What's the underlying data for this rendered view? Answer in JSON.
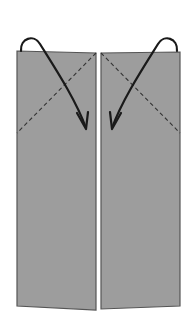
{
  "diagram": {
    "type": "origami-fold-step",
    "colors": {
      "background": "#ffffff",
      "paper_fill": "#9d9d9d",
      "paper_edge": "#555555",
      "fold_line": "#333333",
      "arrow": "#1a1a1a",
      "center_gap": "#ffffff"
    },
    "panels": [
      {
        "name": "left-flap",
        "points": "17,51 96,53 96,310 17,306"
      },
      {
        "name": "right-flap",
        "points": "101,53 180,52 180,306 101,309"
      }
    ],
    "fold_lines": [
      {
        "name": "left-valley-fold",
        "x1": 96,
        "y1": 53,
        "x2": 17,
        "y2": 133
      },
      {
        "name": "right-valley-fold",
        "x1": 101,
        "y1": 53,
        "x2": 180,
        "y2": 133
      }
    ],
    "arrows": [
      {
        "name": "left-fold-arrow",
        "path": "M21,51 C20,38 34,34 40,44 C55,68 76,100 86,128",
        "head": "M77,113 L86,129 L88,112"
      },
      {
        "name": "right-fold-arrow",
        "path": "M177,51 C178,38 164,34 158,44 C143,68 122,100 112,128",
        "head": "M121,113 L112,129 L110,112"
      }
    ]
  }
}
